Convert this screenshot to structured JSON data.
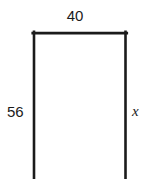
{
  "figure": {
    "kind": "open-rectangle-diagram",
    "background_color": "#ffffff",
    "stroke_color": "#1b1b1b",
    "stroke_width_px": 2.6,
    "shape": {
      "name": "rectangle",
      "top_edge_drawn": true,
      "left_edge_drawn": true,
      "right_edge_drawn": true,
      "bottom_edge_drawn": false,
      "bottom_edge_note": "cropped by image boundary",
      "left_x": 34,
      "right_x": 125.5,
      "top_y": 33,
      "bottom_y": 179
    },
    "labels": {
      "top": "40",
      "left": "56",
      "right": "x"
    }
  }
}
